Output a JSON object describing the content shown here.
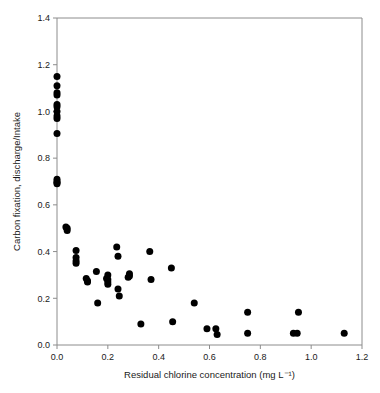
{
  "chart_data": {
    "type": "scatter",
    "title": "",
    "subtitle": "",
    "xlabel": "Residual chlorine concentration (mg L⁻¹)",
    "ylabel": "Carbon fixation, discharge/Intake",
    "xlim": [
      0.0,
      1.2
    ],
    "ylim": [
      0.0,
      1.4
    ],
    "xticks": [
      0.0,
      0.2,
      0.4,
      0.6,
      0.8,
      1.0,
      1.2
    ],
    "xtick_labels": [
      "0.0",
      "0.2",
      "0.4",
      "0.6",
      "0.8",
      "1.0",
      "1.2"
    ],
    "yticks": [
      0.0,
      0.2,
      0.4,
      0.6,
      0.8,
      1.0,
      1.2,
      1.4
    ],
    "ytick_labels": [
      "0.0",
      "0.2",
      "0.4",
      "0.6",
      "0.8",
      "1.0",
      "1.2",
      "1.4"
    ],
    "grid": false,
    "legend": null,
    "marker": "filled-circle",
    "marker_color": "#000000",
    "marker_size": 4.6,
    "series": [
      {
        "name": "Carbon fixation ratio",
        "x": [
          0.0,
          0.0,
          0.0,
          0.0,
          0.0,
          0.0,
          0.0,
          0.0,
          0.0,
          0.0,
          0.0,
          0.0,
          0.0,
          0.0,
          0.035,
          0.04,
          0.04,
          0.075,
          0.075,
          0.075,
          0.075,
          0.115,
          0.12,
          0.12,
          0.155,
          0.16,
          0.195,
          0.2,
          0.2,
          0.2,
          0.2,
          0.235,
          0.24,
          0.24,
          0.245,
          0.28,
          0.285,
          0.285,
          0.33,
          0.365,
          0.37,
          0.45,
          0.455,
          0.54,
          0.59,
          0.625,
          0.63,
          0.75,
          0.75,
          0.93,
          0.945,
          0.95,
          1.13
        ],
        "y": [
          1.15,
          1.11,
          1.08,
          1.07,
          1.03,
          1.02,
          1.0,
          0.98,
          0.97,
          0.905,
          0.71,
          0.7,
          0.695,
          0.69,
          0.505,
          0.5,
          0.49,
          0.405,
          0.375,
          0.36,
          0.35,
          0.285,
          0.275,
          0.27,
          0.315,
          0.18,
          0.285,
          0.3,
          0.28,
          0.27,
          0.26,
          0.42,
          0.38,
          0.24,
          0.21,
          0.29,
          0.305,
          0.295,
          0.09,
          0.4,
          0.28,
          0.33,
          0.1,
          0.18,
          0.07,
          0.07,
          0.045,
          0.14,
          0.05,
          0.05,
          0.05,
          0.14,
          0.05
        ],
        "color": "#000000"
      }
    ]
  },
  "figure": {
    "background_color": "#ffffff",
    "axis_color": "#8c8c8c",
    "text_color": "#1a1a1a"
  }
}
